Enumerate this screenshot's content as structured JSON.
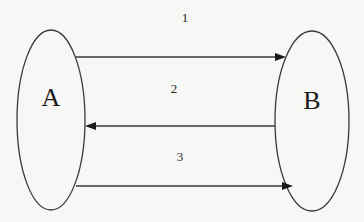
{
  "diagram": {
    "type": "node-link",
    "colors": {
      "background": "#f7f7f5",
      "stroke": "#3a3a3a",
      "text": "#1a1a1a"
    },
    "nodes": [
      {
        "id": "A",
        "label": "A",
        "shape": "ellipse",
        "cx": 51,
        "cy": 120,
        "rx": 34,
        "ry": 90
      },
      {
        "id": "B",
        "label": "B",
        "shape": "ellipse",
        "cx": 312,
        "cy": 121,
        "rx": 37,
        "ry": 90
      }
    ],
    "edges": [
      {
        "id": "1",
        "label": "1",
        "from": "A",
        "to": "B",
        "x1": 76,
        "x2": 285,
        "y": 57,
        "label_x": 185,
        "label_y": 20
      },
      {
        "id": "2",
        "label": "2",
        "from": "B",
        "to": "A",
        "x1": 275,
        "x2": 86,
        "y": 126,
        "label_x": 174,
        "label_y": 92
      },
      {
        "id": "3",
        "label": "3",
        "from": "A",
        "to": "B",
        "x1": 76,
        "x2": 292,
        "y": 186,
        "label_x": 180,
        "label_y": 160
      }
    ]
  }
}
